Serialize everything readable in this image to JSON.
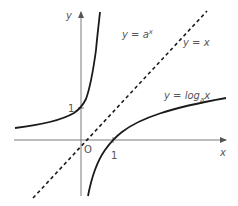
{
  "diagram": {
    "axes": {
      "x_label": "x",
      "y_label": "y",
      "origin_label": "O"
    },
    "ticks": {
      "x_tick_label": "1",
      "y_tick_label": "1"
    },
    "curves": [
      {
        "name": "exponential",
        "label_prefix": "y = a",
        "label_sup": "x",
        "style": "solid"
      },
      {
        "name": "identity",
        "label": "y = x",
        "style": "dashed"
      },
      {
        "name": "logarithm",
        "label_prefix": "y = log",
        "label_sub": "a",
        "label_suffix": "x",
        "style": "solid"
      }
    ],
    "colors": {
      "curve": "#1a1a1a",
      "axis": "#7a7a7a",
      "text": "#555555",
      "background": "#ffffff"
    }
  }
}
